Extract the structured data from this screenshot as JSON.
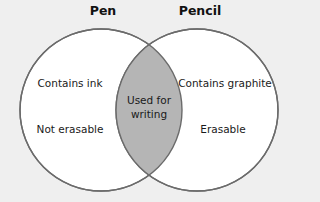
{
  "diagram": {
    "type": "venn",
    "colors": {
      "background": "#efefef",
      "circle_fill": "#ffffff",
      "circle_stroke": "#6b6b6b",
      "overlap_fill": "#b5b5b5"
    },
    "sets": [
      {
        "title": "Pen",
        "items": [
          "Contains ink",
          "Not erasable"
        ]
      },
      {
        "title": "Pencil",
        "items": [
          "Contains graphite",
          "Erasable"
        ]
      }
    ],
    "overlap": {
      "line1": "Used for",
      "line2": "writing"
    }
  }
}
